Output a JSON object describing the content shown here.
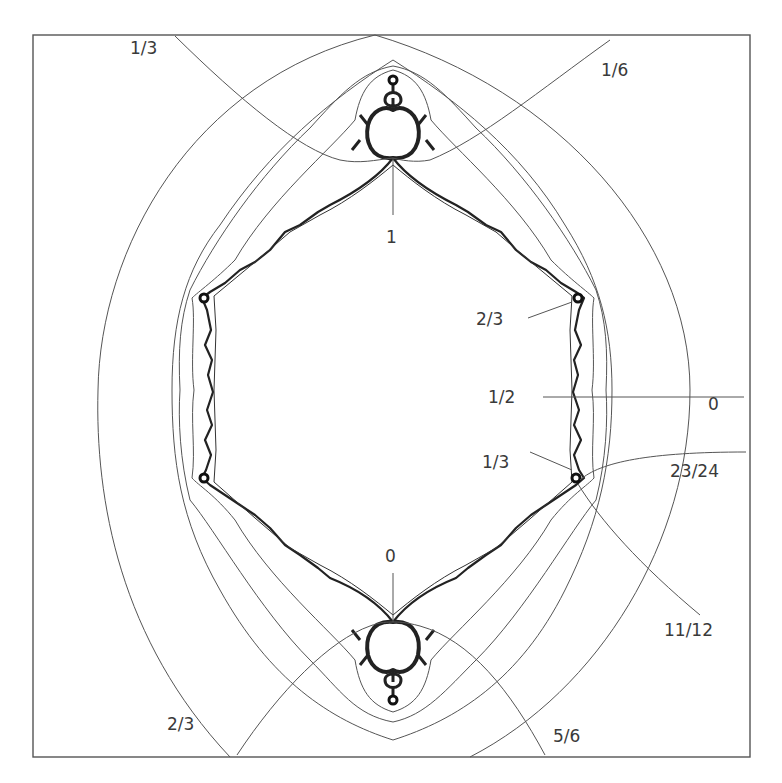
{
  "diagram": {
    "title": "",
    "frame": {
      "x": 33,
      "y": 35,
      "width": 717,
      "height": 722,
      "stroke": "#555555"
    },
    "colors": {
      "line": "#555555",
      "set": "#222222",
      "text": "#3a3a3a",
      "background": "#ffffff"
    },
    "labels": [
      {
        "id": "ray-top-left",
        "text": "1/3",
        "x": 130,
        "y": 54
      },
      {
        "id": "ray-top-right",
        "text": "1/6",
        "x": 601,
        "y": 76
      },
      {
        "id": "cusp-top",
        "text": "1",
        "x": 386,
        "y": 243
      },
      {
        "id": "cusp-upper-right",
        "text": "2/3",
        "x": 476,
        "y": 325
      },
      {
        "id": "ray-right-zero",
        "text": "0",
        "x": 708,
        "y": 410
      },
      {
        "id": "ray-right-half",
        "text": "1/2",
        "x": 488,
        "y": 403
      },
      {
        "id": "cusp-lower-right",
        "text": "1/3",
        "x": 482,
        "y": 468
      },
      {
        "id": "ray-23-24",
        "text": "23/24",
        "x": 670,
        "y": 477
      },
      {
        "id": "cusp-bottom",
        "text": "0",
        "x": 385,
        "y": 562
      },
      {
        "id": "ray-11-12",
        "text": "11/12",
        "x": 664,
        "y": 636
      },
      {
        "id": "ray-bottom-left",
        "text": "2/3",
        "x": 167,
        "y": 730
      },
      {
        "id": "ray-bottom-right",
        "text": "5/6",
        "x": 553,
        "y": 742
      }
    ]
  }
}
